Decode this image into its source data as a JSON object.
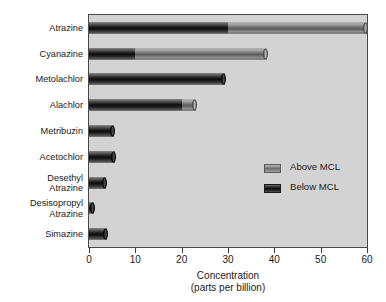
{
  "chart_data": {
    "type": "bar",
    "orientation": "horizontal",
    "stacked": true,
    "title": "",
    "xlabel": "Concentration\n(parts per billion)",
    "xlabel_line1": "Concentration",
    "xlabel_line2": "(parts per billion)",
    "ylabel": "",
    "xlim": [
      0,
      60
    ],
    "xticks": [
      0,
      10,
      20,
      30,
      40,
      50,
      60
    ],
    "xtick_labels": [
      "0",
      "10",
      "20",
      "30",
      "40",
      "50",
      "60"
    ],
    "grid": false,
    "legend_position": "center-right",
    "plot_background": "#d3d3d3",
    "categories": [
      "Atrazine",
      "Cyanazine",
      "Metolachlor",
      "Alachlor",
      "Metribuzin",
      "Acetochlor",
      "Desethyl\nAtrazine",
      "Desisopropyl\nAtrazine",
      "Simazine"
    ],
    "series": [
      {
        "name": "Below MCL",
        "color": "#1a1a1a",
        "values": [
          30.0,
          10.0,
          29.3,
          20.0,
          5.5,
          5.6,
          3.7,
          1.0,
          3.8
        ]
      },
      {
        "name": "Above MCL",
        "color": "#8a8a8a",
        "values": [
          30.0,
          28.5,
          0.0,
          3.0,
          0.0,
          0.0,
          0.0,
          0.0,
          0.0
        ]
      }
    ],
    "totals": [
      60.0,
      38.5,
      29.3,
      23.0,
      5.5,
      5.6,
      3.7,
      1.0,
      3.8
    ]
  },
  "legend": {
    "items": [
      {
        "label": "Above MCL",
        "swatch": "above"
      },
      {
        "label": "Below MCL",
        "swatch": "below"
      }
    ]
  }
}
